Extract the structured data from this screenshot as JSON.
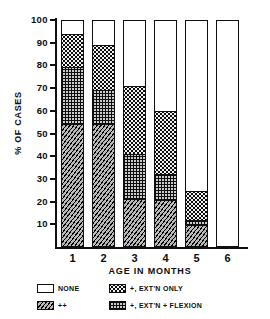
{
  "chart_data": {
    "type": "bar",
    "title": "",
    "subtitle": "",
    "xlabel": "AGE IN MONTHS",
    "ylabel": "% OF CASES",
    "categories": [
      "1",
      "2",
      "3",
      "4",
      "5",
      "6"
    ],
    "ylim": [
      0,
      100
    ],
    "yticks": [
      10,
      20,
      30,
      40,
      50,
      60,
      70,
      80,
      90,
      100
    ],
    "ytick_labels": [
      "10",
      "20",
      "30",
      "40",
      "50",
      "60",
      "70",
      "80",
      "90",
      "100"
    ],
    "grid": false,
    "stacked": true,
    "legend_position": "below",
    "series": [
      {
        "name": "++",
        "pattern": "diagonal-hatch",
        "color": "#b9b9b9",
        "values": [
          54,
          54,
          20.5,
          20,
          9,
          0
        ]
      },
      {
        "name": "+, EXT'N + FLEXION",
        "pattern": "cross-hatch",
        "color": "#cccccc",
        "values": [
          25,
          15,
          20,
          11.5,
          2,
          0
        ]
      },
      {
        "name": "+, EXT'N ONLY",
        "pattern": "stipple",
        "color": "#f2f2f2",
        "values": [
          15,
          20,
          30,
          28,
          13,
          0
        ]
      },
      {
        "name": "NONE",
        "pattern": "solid-white",
        "color": "#ffffff",
        "values": [
          6,
          11,
          29.5,
          40.5,
          76,
          100
        ]
      }
    ],
    "cumulative_tops": {
      "++": [
        54,
        54,
        20.5,
        20,
        9,
        0
      ],
      "+, EXT'N + FLEXION": [
        79,
        69,
        40.5,
        31.5,
        11,
        0
      ],
      "+, EXT'N ONLY": [
        94,
        89,
        70.5,
        59.5,
        24,
        0
      ],
      "NONE": [
        100,
        100,
        100,
        100,
        100,
        100
      ]
    },
    "annotations": []
  },
  "legend": {
    "entries": [
      {
        "label": "NONE",
        "pattern": "solid-white"
      },
      {
        "label": "+, EXT'N ONLY",
        "pattern": "stipple"
      },
      {
        "label": "++",
        "pattern": "diagonal-hatch"
      },
      {
        "label": "+, EXT'N + FLEXION",
        "pattern": "cross-hatch"
      }
    ]
  },
  "axis": {
    "y_title": "% OF CASES",
    "x_title": "AGE IN MONTHS"
  }
}
